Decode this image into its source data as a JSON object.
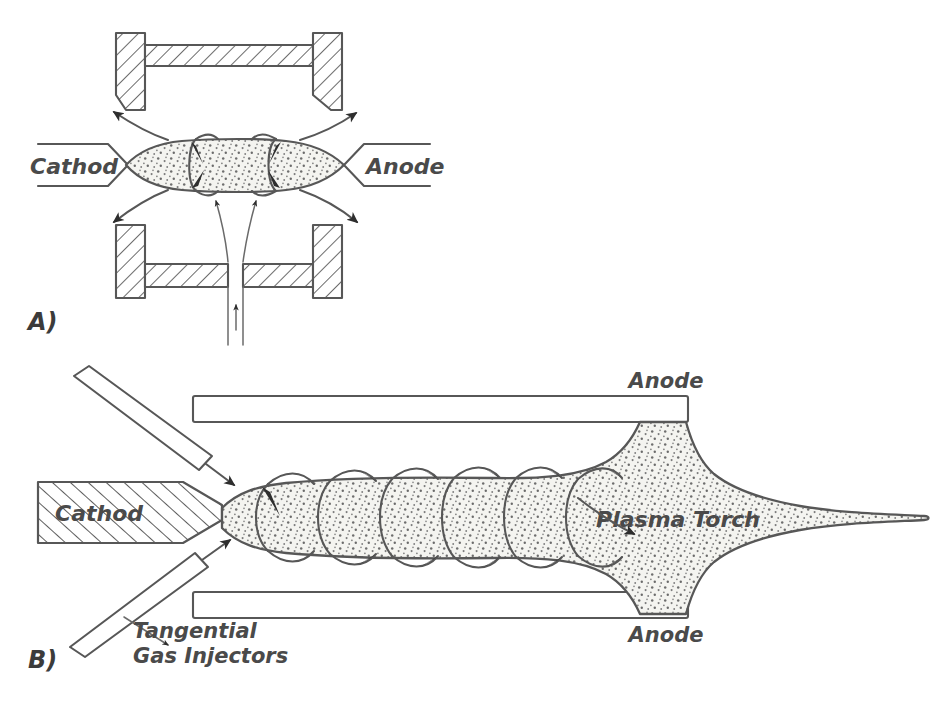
{
  "figure": {
    "background_color": "#ffffff",
    "ink_color": "#575757",
    "label_color": "#4a4a4a",
    "plasma_fill_color": "#f2f2ee",
    "plasma_speckle_color": "#6e6e6e",
    "arrow_color": "#2e2e2e"
  },
  "panel_a": {
    "key": "A)",
    "cathode_label": "Cathod",
    "anode_label": "Anode",
    "description": "Non-transferred arc plasma torch, cross section: cathode at left, anode at right, hatched confining chamber above and below, gas entering from below and exiting at the sides"
  },
  "panel_b": {
    "key": "B)",
    "cathode_label": "Cathod",
    "anode_top_label": "Anode",
    "anode_bottom_label": "Anode",
    "plasma_label": "Plasma Torch",
    "injector_label_line1": "Tangential",
    "injector_label_line2": "Gas Injectors",
    "description": "Vortex stabilized plasma torch: hatched cathode at left, two tangential gas injectors, helical swirl flow around the plasma column, anode bars top and bottom, plasma torch plume exiting right"
  }
}
